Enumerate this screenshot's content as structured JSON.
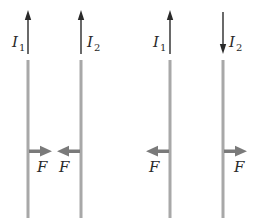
{
  "diagram": {
    "colors": {
      "wire": "#a8a8a8",
      "current_arrow": "#2a2a2a",
      "force_arrow": "#7a7a7a",
      "text": "#2a2a2a",
      "background": "#ffffff"
    },
    "panels": [
      {
        "name": "parallel-currents",
        "wires": [
          {
            "x": 28,
            "current_label": "I",
            "current_subscript": "1",
            "current_direction": "up",
            "force_direction": "right",
            "force_label": "F"
          },
          {
            "x": 81,
            "current_label": "I",
            "current_subscript": "2",
            "current_direction": "up",
            "force_direction": "left",
            "force_label": "F"
          }
        ],
        "result": "attract"
      },
      {
        "name": "antiparallel-currents",
        "wires": [
          {
            "x": 170,
            "current_label": "I",
            "current_subscript": "1",
            "current_direction": "up",
            "force_direction": "left",
            "force_label": "F"
          },
          {
            "x": 223,
            "current_label": "I",
            "current_subscript": "2",
            "current_direction": "down",
            "force_direction": "right",
            "force_label": "F"
          }
        ],
        "result": "repel"
      }
    ]
  },
  "labels": {
    "p1_i1": "I",
    "p1_i1_sub": "1",
    "p1_i2": "I",
    "p1_i2_sub": "2",
    "p2_i1": "I",
    "p2_i1_sub": "1",
    "p2_i2": "I",
    "p2_i2_sub": "2",
    "p1_f1": "F",
    "p1_f2": "F",
    "p2_f1": "F",
    "p2_f2": "F"
  }
}
